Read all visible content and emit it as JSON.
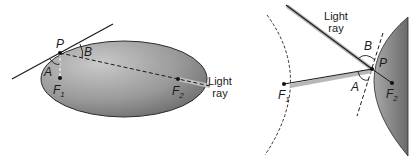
{
  "left_panel": {
    "shape": "ellipse",
    "point_label": "P",
    "angle_a_label": "A",
    "angle_b_label": "B",
    "focus1_label": "F",
    "focus1_sub": "1",
    "focus2_label": "F",
    "focus2_sub": "2",
    "ray_label_line1": "Light",
    "ray_label_line2": "ray"
  },
  "right_panel": {
    "shape": "hyperbola",
    "point_label": "P",
    "angle_a_label": "A",
    "angle_b_label": "B",
    "focus1_label": "F",
    "focus1_sub": "1",
    "focus2_label": "F",
    "focus2_sub": "2",
    "ray_label_line1": "Light",
    "ray_label_line2": "ray"
  },
  "colors": {
    "fill_dark": "#6e6e6e",
    "fill_light": "#c4c4c4",
    "line": "#1a1a1a",
    "ray_shadow": "#b0b0b0"
  }
}
